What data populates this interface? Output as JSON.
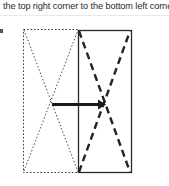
{
  "caption": {
    "text": "the top right corner to the bottom left corner."
  },
  "figure": {
    "ghost_rectangle": {
      "label": "original position (dotted outline)",
      "style": "dotted",
      "x": 23,
      "y": 11,
      "width": 55,
      "height": 143,
      "color": "#3a3a3a"
    },
    "solid_rectangle": {
      "label": "folded position (solid outline)",
      "style": "solid",
      "x": 78,
      "y": 12,
      "width": 53,
      "height": 142,
      "color": "#2a2a2a"
    },
    "ghost_diagonal": {
      "label": "dotted diagonal from top left corner to bottom right corner",
      "style": "dotted",
      "x1": 24,
      "y1": 12,
      "x2": 78,
      "y2": 154,
      "color": "#4a4a4a"
    },
    "ghost_diagonal_2": {
      "label": "dotted diagonal from bottom left corner to top right corner",
      "style": "dotted",
      "x1": 24,
      "y1": 153,
      "x2": 78,
      "y2": 12,
      "color": "#4a4a4a"
    },
    "dashed_diagonal": {
      "label": "bold dashed diagonal from bottom left corner to top right corner",
      "style": "dashed",
      "x1": 79,
      "y1": 154,
      "x2": 130,
      "y2": 13,
      "color": "#222222"
    },
    "dashed_diagonal_2": {
      "label": "bold dashed diagonal from top left corner to bottom right corner",
      "style": "dashed",
      "x1": 79,
      "y1": 13,
      "x2": 130,
      "y2": 154,
      "color": "#222222"
    },
    "motion_arrow": {
      "label": "rightward motion arrow",
      "x1": 52,
      "y1": 86,
      "x2": 104,
      "y2": 86,
      "color": "#1a1a1a",
      "thickness": 3
    },
    "left_tick": {
      "label": "margin tick mark"
    }
  }
}
